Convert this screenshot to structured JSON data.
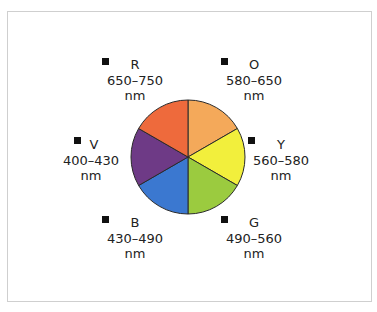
{
  "diagram": {
    "title": "",
    "wheel": {
      "center": [
        188,
        157
      ],
      "radius": 57,
      "outline_color": "#2a2a2a"
    },
    "segments": [
      {
        "key": "R",
        "name": "red",
        "letter": "R",
        "range": "650–750",
        "unit": "nm",
        "color": "#ee6a3c"
      },
      {
        "key": "O",
        "name": "orange",
        "letter": "O",
        "range": "580–650",
        "unit": "nm",
        "color": "#f4a95a"
      },
      {
        "key": "Y",
        "name": "yellow",
        "letter": "Y",
        "range": "560–580",
        "unit": "nm",
        "color": "#f2ef3c"
      },
      {
        "key": "G",
        "name": "green",
        "letter": "G",
        "range": "490–560",
        "unit": "nm",
        "color": "#9bcb3f"
      },
      {
        "key": "B",
        "name": "blue",
        "letter": "B",
        "range": "430–490",
        "unit": "nm",
        "color": "#3b78d0"
      },
      {
        "key": "V",
        "name": "violet",
        "letter": "V",
        "range": "400–430",
        "unit": "nm",
        "color": "#6e3a86"
      }
    ]
  }
}
